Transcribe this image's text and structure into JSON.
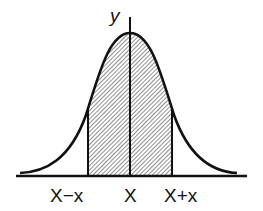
{
  "diagram": {
    "type": "normal-distribution-curve",
    "y_axis_label": "y",
    "x_labels": {
      "left": "X−x",
      "center": "X",
      "right": "X+x"
    },
    "shaded_region": "area between X−x and X+x (hatched)",
    "colors": {
      "line": "#111111",
      "hatch": "#555555",
      "background": "#ffffff"
    }
  }
}
